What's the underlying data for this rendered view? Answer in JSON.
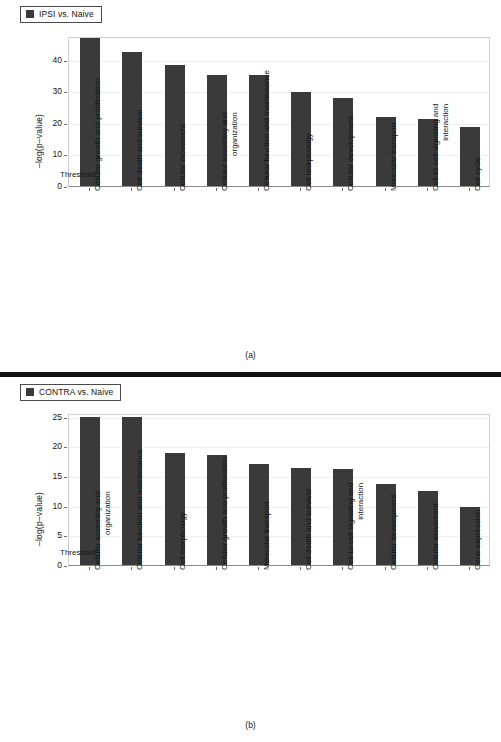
{
  "figure": {
    "panel_a_caption": "(a)",
    "panel_b_caption": "(b)",
    "bar_color": "#3a3a3a",
    "threshold_label": "Threshold"
  },
  "chart_data": [
    {
      "type": "bar",
      "title": "IPSI vs. Naive",
      "panel": "(a)",
      "xlabel": "",
      "ylabel": "–log(p–value)",
      "ylim": [
        0,
        47.5
      ],
      "yticks": [
        0,
        10,
        20,
        30,
        40
      ],
      "grid": true,
      "legend_position": "top-left",
      "legend_entries": [
        "IPSI vs. Naive"
      ],
      "annotations": [
        "Threshold"
      ],
      "categories": [
        "Cellular growth and proliferation",
        "Cell death and survival",
        "Cellular movement",
        "Cellular assembly and organization",
        "Cellular function and maintenance",
        "Cell morphology",
        "Cellular development",
        "Molecular transport",
        "Cell-to-cell signaling and interaction",
        "Cell cycle"
      ],
      "values": [
        46.8,
        42.4,
        38.3,
        35.2,
        35.0,
        29.9,
        27.8,
        21.7,
        21.1,
        18.7
      ]
    },
    {
      "type": "bar",
      "title": "CONTRA vs. Naive",
      "panel": "(b)",
      "xlabel": "",
      "ylabel": "–log(p–value)",
      "ylim": [
        0,
        25.6
      ],
      "yticks": [
        0,
        5,
        10,
        15,
        20,
        25
      ],
      "grid": true,
      "legend_position": "top-left",
      "legend_entries": [
        "CONTRA vs. Naive"
      ],
      "annotations": [
        "Threshold"
      ],
      "categories": [
        "Cellular assembly and organization",
        "Cellular function and maintenance",
        "Cell morphology",
        "Cellular growth and proliferation",
        "Molecular transport",
        "Cell death and survival",
        "Cell-to-cell signaling and interaction",
        "Cellular development",
        "Cellular movement",
        "Gene expression"
      ],
      "values": [
        25.0,
        25.0,
        18.9,
        18.6,
        17.0,
        16.4,
        16.2,
        13.6,
        12.4,
        9.8
      ]
    }
  ]
}
